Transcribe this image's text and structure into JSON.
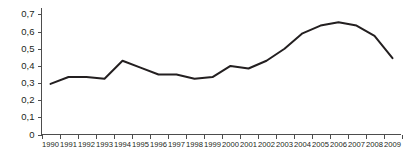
{
  "chart_data": {
    "type": "line",
    "title": "",
    "subtitle": "",
    "xlabel": "",
    "ylabel": "",
    "categories": [
      "1990",
      "1991",
      "1992",
      "1993",
      "1994",
      "1995",
      "1996",
      "1997",
      "1998",
      "1999",
      "2000",
      "2001",
      "2002",
      "2003",
      "2004",
      "2005",
      "2006",
      "2007",
      "2008",
      "2009"
    ],
    "values": [
      0.295,
      0.335,
      0.335,
      0.325,
      0.43,
      0.39,
      0.35,
      0.35,
      0.325,
      0.335,
      0.4,
      0.385,
      0.43,
      0.5,
      0.59,
      0.635,
      0.655,
      0.635,
      0.575,
      0.445
    ],
    "series": [
      {
        "name": "",
        "values": [
          0.295,
          0.335,
          0.335,
          0.325,
          0.43,
          0.39,
          0.35,
          0.35,
          0.325,
          0.335,
          0.4,
          0.385,
          0.43,
          0.5,
          0.59,
          0.635,
          0.655,
          0.635,
          0.575,
          0.445
        ]
      }
    ],
    "ylim": [
      0,
      0.7
    ],
    "yticks": [
      0,
      0.1,
      0.2,
      0.3,
      0.4,
      0.5,
      0.6,
      0.7
    ],
    "ytick_labels": [
      "0",
      "0,1",
      "0,2",
      "0,3",
      "0,4",
      "0,5",
      "0,6",
      "0,7"
    ],
    "xtick_labels": [
      "1990",
      "1991",
      "1992",
      "1993",
      "1994",
      "1995",
      "1996",
      "1997",
      "1998",
      "1999",
      "2000",
      "2001",
      "2002",
      "2003",
      "2004",
      "2005",
      "2006",
      "2007",
      "2008",
      "2009"
    ],
    "grid": false,
    "legend": false,
    "legend_position": "none",
    "line_color": "#231f20",
    "axis_color": "#4d4d4d",
    "background_color": "#ffffff",
    "decimal_separator": ","
  }
}
